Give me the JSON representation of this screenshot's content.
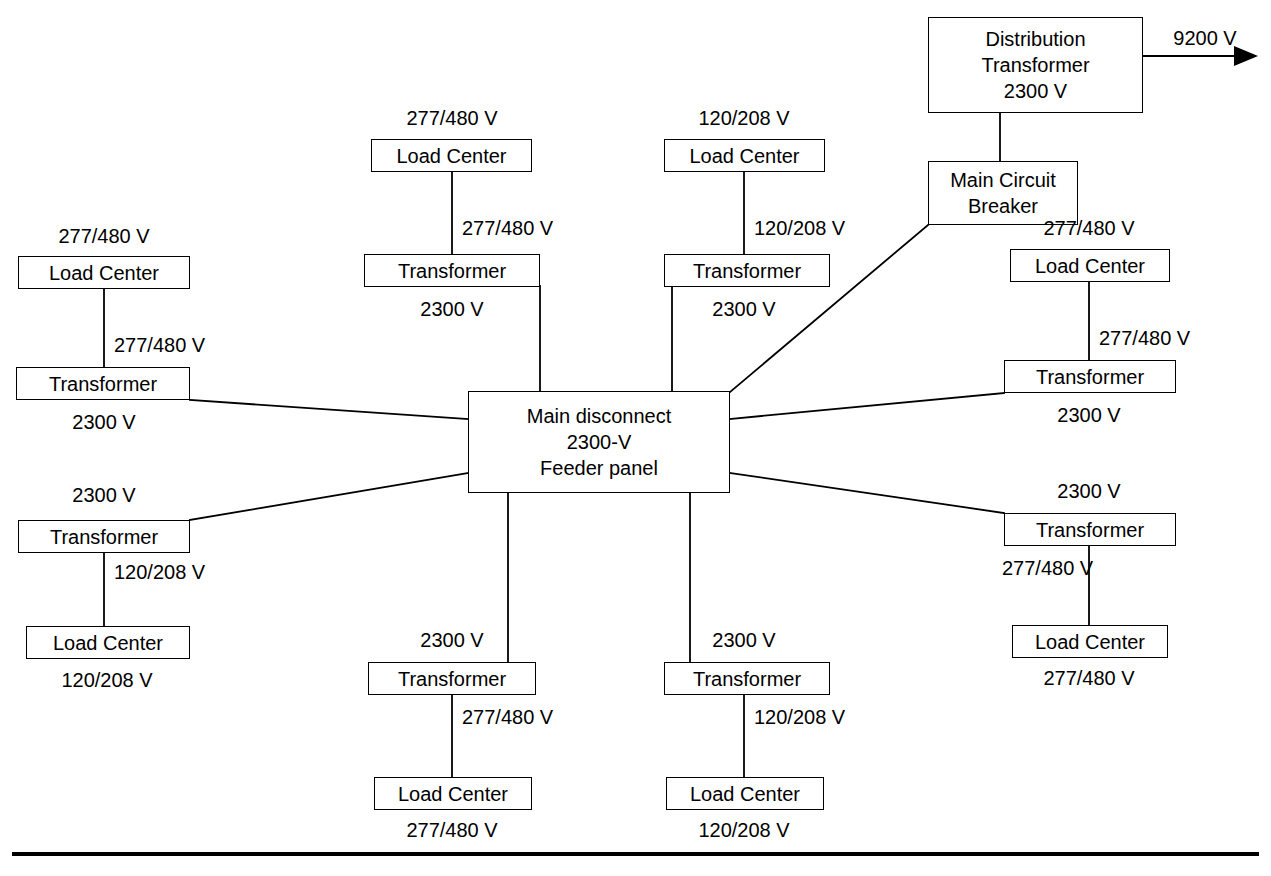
{
  "diagram": {
    "stroke_color": "#000000",
    "background_color": "#ffffff",
    "nodes": {
      "distribution_transformer": {
        "lines": [
          "Distribution",
          "Transformer",
          "2300 V"
        ]
      },
      "main_circuit_breaker": {
        "lines": [
          "Main Circuit",
          "Breaker"
        ]
      },
      "main_disconnect_panel": {
        "lines": [
          "Main disconnect",
          "2300-V",
          "Feeder panel"
        ]
      },
      "transformer_label": "Transformer",
      "load_center_label": "Load Center"
    },
    "outgoing_feed": {
      "voltage": "9200 V",
      "arrow": "arrow-right"
    },
    "branches": [
      {
        "id": "left-upper",
        "load_center_top_voltage": "277/480 V",
        "load_center": "Load Center",
        "mid_voltage": "277/480 V",
        "transformer": "Transformer",
        "transformer_voltage": "2300 V"
      },
      {
        "id": "left-lower",
        "transformer_top_voltage": "2300 V",
        "transformer": "Transformer",
        "mid_voltage": "120/208 V",
        "load_center": "Load Center",
        "load_center_bottom_voltage": "120/208 V"
      },
      {
        "id": "top-left",
        "load_center_top_voltage": "277/480 V",
        "load_center": "Load Center",
        "mid_voltage": "277/480 V",
        "transformer": "Transformer",
        "transformer_voltage": "2300 V"
      },
      {
        "id": "top-right",
        "load_center_top_voltage": "120/208 V",
        "load_center": "Load Center",
        "mid_voltage": "120/208 V",
        "transformer": "Transformer",
        "transformer_voltage": "2300 V"
      },
      {
        "id": "right-upper",
        "load_center_top_voltage": "277/480 V",
        "load_center": "Load Center",
        "mid_voltage": "277/480 V",
        "transformer": "Transformer",
        "transformer_voltage": "2300 V"
      },
      {
        "id": "right-lower",
        "transformer_top_voltage": "2300 V",
        "transformer": "Transformer",
        "mid_voltage": "277/480 V",
        "load_center": "Load Center",
        "load_center_bottom_voltage": "277/480 V"
      },
      {
        "id": "bottom-left",
        "transformer_top_voltage": "2300 V",
        "transformer": "Transformer",
        "mid_voltage": "277/480 V",
        "load_center": "Load Center",
        "load_center_bottom_voltage": "277/480 V"
      },
      {
        "id": "bottom-right",
        "transformer_top_voltage": "2300 V",
        "transformer": "Transformer",
        "mid_voltage": "120/208 V",
        "load_center": "Load Center",
        "load_center_bottom_voltage": "120/208 V"
      }
    ]
  }
}
